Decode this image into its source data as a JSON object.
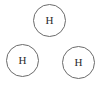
{
  "diagram": {
    "type": "molecular-atom-diagram",
    "background_color": "#ffffff",
    "width": 102,
    "height": 85,
    "circle_stroke_color": "#6b6b6b",
    "circle_stroke_width": 1,
    "circle_fill_color": "#ffffff",
    "label_color": "#2b2b2b",
    "label_font_size": 11,
    "atoms": [
      {
        "id": "atom-top",
        "label": "H",
        "element_name": "hydrogen",
        "position": "top-center",
        "center_x": 49,
        "center_y": 20,
        "diameter": 33,
        "left": 33,
        "top": 4
      },
      {
        "id": "atom-bottom-left",
        "label": "H",
        "element_name": "hydrogen",
        "position": "bottom-left",
        "center_x": 22,
        "center_y": 61,
        "diameter": 33,
        "left": 6,
        "top": 44
      },
      {
        "id": "atom-bottom-right",
        "label": "H",
        "element_name": "hydrogen",
        "position": "bottom-right",
        "center_x": 78,
        "center_y": 62,
        "diameter": 33,
        "left": 62,
        "top": 46
      }
    ]
  }
}
